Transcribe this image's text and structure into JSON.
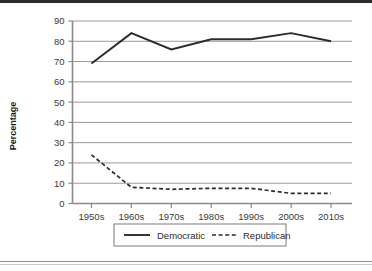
{
  "figure": {
    "background_color": "#ffffff",
    "top_rule_color": "#2b2b2b",
    "bottom_rule_color": "#8f8f8f"
  },
  "chart_data": {
    "type": "line",
    "title": "",
    "xlabel": "",
    "ylabel": "Percentage",
    "categories": [
      "1950s",
      "1960s",
      "1970s",
      "1980s",
      "1990s",
      "2000s",
      "2010s"
    ],
    "series": [
      {
        "name": "Democratic",
        "values": [
          69,
          84,
          76,
          81,
          81,
          84,
          80
        ],
        "style": "solid",
        "color": "#2b2b2b"
      },
      {
        "name": "Republican",
        "values": [
          24,
          8,
          7,
          7.5,
          7.5,
          5,
          5
        ],
        "style": "dashed",
        "color": "#2b2b2b"
      }
    ],
    "ylim": [
      0,
      90
    ],
    "ytick_step": 10,
    "yticks": [
      "0",
      "10",
      "20",
      "30",
      "40",
      "50",
      "60",
      "70",
      "80",
      "90"
    ],
    "grid": true,
    "grid_axis": "y",
    "grid_color": "#9a9a9a",
    "axis_color": "#8a8a8a",
    "legend_position": "bottom-center",
    "legend_border_color": "#7a7a7a"
  },
  "legend": {
    "entries": [
      {
        "label": "Democratic",
        "style": "solid"
      },
      {
        "label": "Republican",
        "style": "dashed"
      }
    ]
  }
}
